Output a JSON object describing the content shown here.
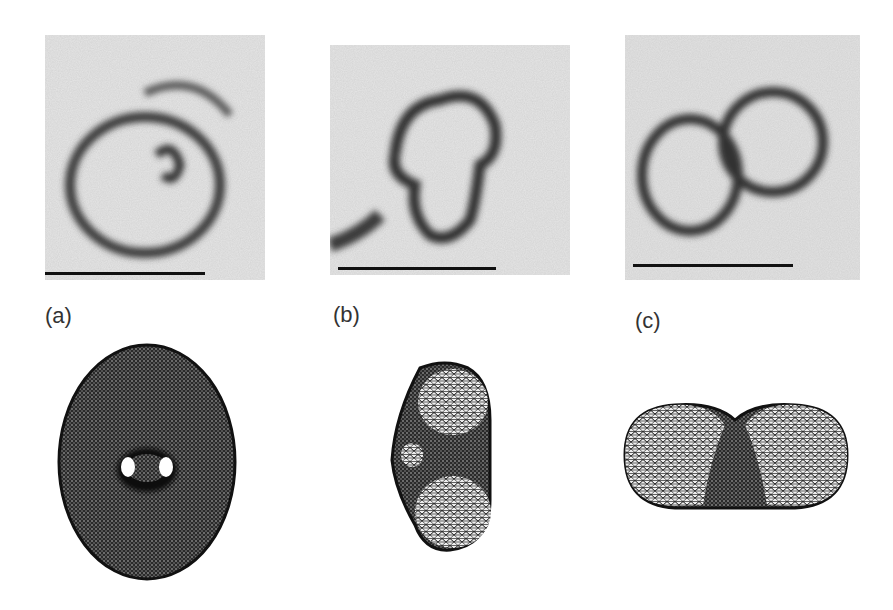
{
  "figure": {
    "panels": [
      {
        "id": "a",
        "label": "(a)",
        "micrograph": "ring-shaped vesicle with inner loop",
        "model": "oblate torus-like shape with two holes"
      },
      {
        "id": "b",
        "label": "(b)",
        "micrograph": "kidney-shaped vesicle",
        "model": "elongated shape with two spherical caps"
      },
      {
        "id": "c",
        "label": "(c)",
        "micrograph": "two connected spherical vesicles",
        "model": "dumbbell-shaped budding vesicle"
      }
    ],
    "scale_bar": "present under each micrograph",
    "colors": {
      "background": "#ffffff",
      "mesh_dark": "#1a1a1a",
      "micro_bg": "#d9d9d9"
    }
  }
}
